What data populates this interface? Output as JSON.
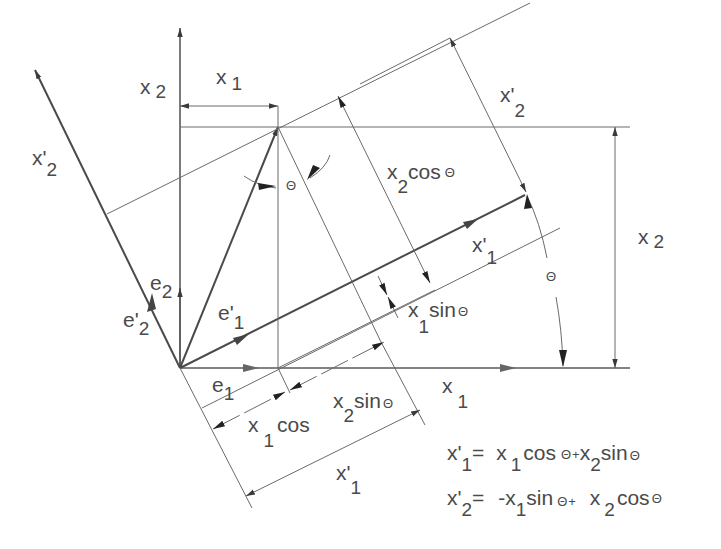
{
  "diagram": {
    "angle_symbol": "Θ",
    "axes": {
      "x1": {
        "base": "x",
        "sub": "1"
      },
      "x2": {
        "base": "x",
        "sub": "2"
      },
      "x1_prime": {
        "base": "x'",
        "sub": "1"
      },
      "x2_prime": {
        "base": "x'",
        "sub": "2"
      }
    },
    "unit_vectors": {
      "e1": {
        "base": "e",
        "sub": "1"
      },
      "e2": {
        "base": "e",
        "sub": "2"
      },
      "e1_prime": {
        "base": "e'",
        "sub": "1"
      },
      "e2_prime": {
        "base": "e'",
        "sub": "2"
      }
    },
    "dimension_labels": {
      "x1_top": {
        "base": "x",
        "sub": "1"
      },
      "x2_left": {
        "base": "x",
        "sub": "2"
      },
      "x2_right": {
        "base": "x",
        "sub": "2"
      },
      "x2_prime_top": {
        "base": "x'",
        "sub": "2"
      },
      "x1_prime_bottom": {
        "base": "x'",
        "sub": "1"
      },
      "x2_cos": {
        "base": "x",
        "sub": "2",
        "tail": "cos",
        "theta": "Θ"
      },
      "x1_sin": {
        "base": "x",
        "sub": "1",
        "tail": "sin",
        "theta": "Θ"
      },
      "x2_sin": {
        "base": "x",
        "sub": "2",
        "tail": "sin",
        "theta": "Θ"
      },
      "x1_cos": {
        "base": "x",
        "sub": "1",
        "tail": "cos"
      }
    },
    "equations": [
      {
        "lhs_base": "x'",
        "lhs_sub": "1",
        "eq": "=",
        "t1_base": "x",
        "t1_sub": "1",
        "t1_fn": "cos",
        "t1_theta": "Θ",
        "op": "+",
        "t2_base": "x",
        "t2_sub": "2",
        "t2_fn": "sin",
        "t2_theta": "Θ"
      },
      {
        "lhs_base": "x'",
        "lhs_sub": "2",
        "eq": "=",
        "t1_base": "-x",
        "t1_sub": "1",
        "t1_fn": "sin",
        "t1_theta": "Θ",
        "op": "+",
        "t2_base": "x",
        "t2_sub": "2",
        "t2_fn": "cos",
        "t2_theta": "Θ"
      }
    ]
  }
}
